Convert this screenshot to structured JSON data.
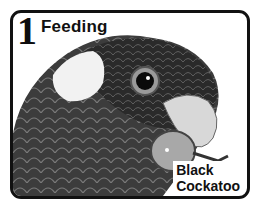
{
  "card": {
    "number": "1",
    "title": "Feeding",
    "species_line1": "Black",
    "species_line2": "Cockatoo"
  },
  "colors": {
    "border": "#111111",
    "background": "#ffffff"
  }
}
